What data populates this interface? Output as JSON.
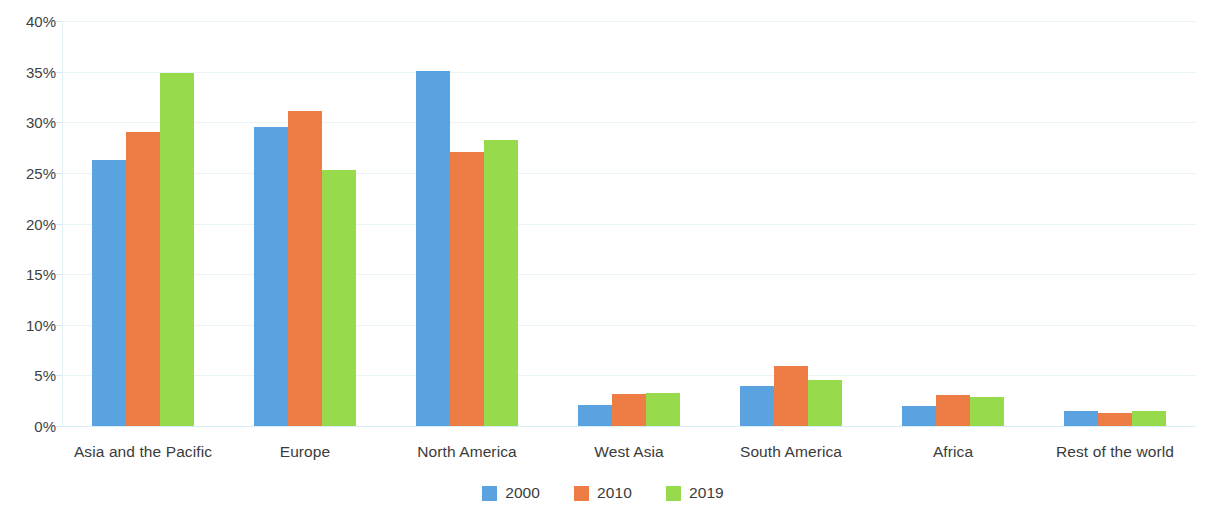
{
  "chart_data": {
    "type": "bar",
    "title": "",
    "subtitle": "",
    "xlabel": "",
    "ylabel": "",
    "ylim": [
      0,
      40
    ],
    "ytick_values": [
      0,
      5,
      10,
      15,
      20,
      25,
      30,
      35,
      40
    ],
    "ytick_labels": [
      "0%",
      "5%",
      "10%",
      "15%",
      "20%",
      "25%",
      "30%",
      "35%",
      "40%"
    ],
    "grid": true,
    "legend_position": "bottom-center",
    "value_suffix": "%",
    "categories": [
      "Asia and the Pacific",
      "Europe",
      "North America",
      "West Asia",
      "South America",
      "Africa",
      "Rest of the world"
    ],
    "series": [
      {
        "name": "2000",
        "color": "#5BA3E0",
        "values": [
          26.3,
          29.5,
          35.1,
          2.1,
          4.0,
          2.0,
          1.5
        ]
      },
      {
        "name": "2010",
        "color": "#ED7D45",
        "values": [
          29.0,
          31.1,
          27.1,
          3.2,
          5.9,
          3.1,
          1.25
        ]
      },
      {
        "name": "2019",
        "color": "#97DA4B",
        "values": [
          34.9,
          25.3,
          28.2,
          3.3,
          4.5,
          2.85,
          1.45
        ]
      }
    ]
  },
  "colors": {
    "series_2000": "#5BA3E0",
    "series_2010": "#ED7D45",
    "series_2019": "#97DA4B",
    "gridline": "#e8f4f8",
    "axis": "#d6eef5",
    "text": "#3b3b3b",
    "background": "#ffffff"
  }
}
